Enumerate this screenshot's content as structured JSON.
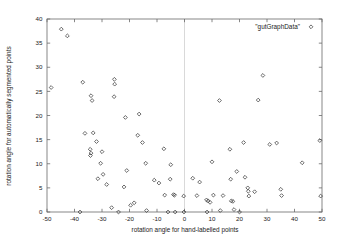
{
  "chart_data": {
    "type": "scatter",
    "title": "",
    "xlabel": "rotation angle for hand-labelled points",
    "ylabel": "rotation angle for automatically segmented points",
    "xlim": [
      -50,
      50
    ],
    "ylim": [
      0,
      40
    ],
    "xticks": [
      -50,
      -40,
      -30,
      -20,
      -10,
      0,
      10,
      20,
      30,
      40,
      50
    ],
    "xtick_labels": [
      "-50",
      "-40",
      "-30",
      "-20",
      "-10",
      "0",
      "10",
      "20",
      "30",
      "40",
      "50"
    ],
    "yticks": [
      0,
      5,
      10,
      15,
      20,
      25,
      30,
      35,
      40
    ],
    "ytick_labels": [
      "0",
      "5",
      "10",
      "15",
      "20",
      "25",
      "30",
      "35",
      "40"
    ],
    "grid": false,
    "vertical_reference_line_x": 0,
    "marker": "diamond",
    "legend": {
      "position": "top-right",
      "entries": [
        {
          "label": "\"gutGraphData\"",
          "marker": "diamond"
        }
      ]
    },
    "series": [
      {
        "name": "\"gutGraphData\"",
        "points": [
          [
            -48.5,
            25.8
          ],
          [
            -44.8,
            37.9
          ],
          [
            -42.6,
            36.5
          ],
          [
            -37.0,
            26.9
          ],
          [
            -38.0,
            0.0
          ],
          [
            -34.0,
            24.1
          ],
          [
            -33.6,
            23.1
          ],
          [
            -36.2,
            16.3
          ],
          [
            -33.2,
            16.4
          ],
          [
            -34.3,
            13.0
          ],
          [
            -34.0,
            12.2
          ],
          [
            -34.2,
            11.7
          ],
          [
            -32.0,
            14.6
          ],
          [
            -30.0,
            12.5
          ],
          [
            -30.5,
            10.1
          ],
          [
            -31.5,
            6.9
          ],
          [
            -29.6,
            7.8
          ],
          [
            -28.3,
            5.7
          ],
          [
            -26.5,
            0.9
          ],
          [
            -25.5,
            27.5
          ],
          [
            -25.4,
            26.5
          ],
          [
            -25.6,
            23.9
          ],
          [
            -24.0,
            0.0
          ],
          [
            -21.5,
            19.6
          ],
          [
            -21.0,
            8.6
          ],
          [
            -22.0,
            5.2
          ],
          [
            -19.6,
            1.4
          ],
          [
            -18.3,
            1.9
          ],
          [
            -17.0,
            15.9
          ],
          [
            -16.5,
            20.3
          ],
          [
            -15.3,
            14.4
          ],
          [
            -14.1,
            10.1
          ],
          [
            -13.8,
            0.3
          ],
          [
            -11.0,
            6.6
          ],
          [
            -9.3,
            6.0
          ],
          [
            -7.5,
            13.1
          ],
          [
            -7.2,
            3.5
          ],
          [
            -6.0,
            0.0
          ],
          [
            -5.0,
            9.8
          ],
          [
            -5.2,
            6.8
          ],
          [
            -4.0,
            3.6
          ],
          [
            -3.6,
            3.5
          ],
          [
            -3.4,
            0.0
          ],
          [
            -0.3,
            3.3
          ],
          [
            -0.2,
            0.0
          ],
          [
            3.0,
            7.0
          ],
          [
            4.5,
            3.4
          ],
          [
            5.5,
            6.2
          ],
          [
            8.0,
            2.5
          ],
          [
            8.6,
            2.3
          ],
          [
            8.2,
            0.0
          ],
          [
            9.3,
            2.0
          ],
          [
            10.0,
            10.4
          ],
          [
            10.5,
            3.5
          ],
          [
            12.7,
            23.1
          ],
          [
            13.0,
            0.3
          ],
          [
            14.0,
            3.4
          ],
          [
            16.5,
            13.0
          ],
          [
            16.8,
            6.8
          ],
          [
            17.0,
            2.3
          ],
          [
            17.6,
            2.2
          ],
          [
            18.0,
            0.5
          ],
          [
            19.0,
            8.4
          ],
          [
            20.0,
            0.0
          ],
          [
            21.5,
            14.4
          ],
          [
            22.0,
            7.2
          ],
          [
            23.0,
            5.0
          ],
          [
            23.2,
            4.3
          ],
          [
            23.4,
            3.3
          ],
          [
            25.5,
            4.2
          ],
          [
            26.8,
            23.2
          ],
          [
            28.5,
            28.3
          ],
          [
            31.0,
            14.0
          ],
          [
            33.5,
            14.3
          ],
          [
            35.0,
            4.7
          ],
          [
            35.3,
            3.4
          ],
          [
            42.8,
            10.2
          ],
          [
            49.2,
            14.8
          ],
          [
            49.5,
            3.3
          ]
        ]
      }
    ]
  }
}
